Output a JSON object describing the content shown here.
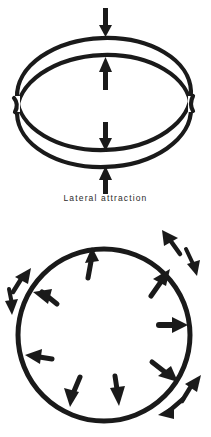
{
  "figure": {
    "background_color": "#ffffff",
    "ink_color": "#1a1a1a",
    "caption_color": "#2b2b2b",
    "width": 211,
    "height": 437
  },
  "panel_top": {
    "name": "Lateral attraction",
    "caption": "Lateral attraction",
    "description": "Two overlapping tilted rings drawn in perspective with four vertical arrows converging on the gap between the rings",
    "rings": [
      {
        "label": "upper ring",
        "cx": 104,
        "cy": 94,
        "rx": 88,
        "ry": 56
      },
      {
        "label": "lower ring",
        "cx": 104,
        "cy": 112,
        "rx": 88,
        "ry": 56
      }
    ],
    "arrows": [
      {
        "label": "top outer arrow",
        "direction": "down",
        "x": 106,
        "from_y": 8,
        "to_y": 36
      },
      {
        "label": "top inner arrow",
        "direction": "up",
        "x": 106,
        "from_y": 88,
        "to_y": 58
      },
      {
        "label": "bottom inner arrow",
        "direction": "down",
        "x": 106,
        "from_y": 124,
        "to_y": 152
      },
      {
        "label": "bottom outer arrow",
        "direction": "up",
        "x": 106,
        "from_y": 194,
        "to_y": 168
      }
    ]
  },
  "panel_bottom": {
    "name": "Radial forces around a circle",
    "caption": "",
    "description": "A single heavy circle with arrows inside pointing outward and arrows outside pointing in mixed radial and tangential directions",
    "circle": {
      "cx": 104,
      "cy": 120,
      "r": 86
    },
    "inside_arrows": [
      {
        "label": "inside top",
        "angle_deg": 285,
        "direction": "outward"
      },
      {
        "label": "inside upper-right",
        "angle_deg": 323,
        "direction": "outward"
      },
      {
        "label": "inside right",
        "angle_deg": 5,
        "direction": "outward"
      },
      {
        "label": "inside lower-right",
        "angle_deg": 43,
        "direction": "outward"
      },
      {
        "label": "inside bottom-right",
        "angle_deg": 75,
        "direction": "outward"
      },
      {
        "label": "inside bottom-left",
        "angle_deg": 109,
        "direction": "outward"
      },
      {
        "label": "inside left",
        "angle_deg": 178,
        "direction": "outward"
      },
      {
        "label": "inside upper-left",
        "angle_deg": 218,
        "direction": "outward"
      }
    ],
    "outside_arrows": [
      {
        "label": "outside upper-right inward",
        "angle_deg": 309,
        "direction": "inward"
      },
      {
        "label": "outside right-upper outward",
        "angle_deg": 333,
        "direction": "outward"
      },
      {
        "label": "outside lower-right outward",
        "angle_deg": 41,
        "direction": "outward"
      },
      {
        "label": "outside lower-right inward",
        "angle_deg": 58,
        "direction": "inward"
      },
      {
        "label": "outside upper-left inward",
        "angle_deg": 215,
        "direction": "inward"
      },
      {
        "label": "outside left outward",
        "angle_deg": 193,
        "direction": "outward"
      }
    ]
  }
}
